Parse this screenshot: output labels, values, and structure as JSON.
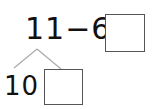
{
  "equation": {
    "expression": "11−6=",
    "answer_box_value": ""
  },
  "decomposition": {
    "part_known": "10",
    "part_unknown_value": ""
  },
  "colors": {
    "text": "#111111",
    "lines": "#aaaaaa",
    "box_border": "#555555"
  }
}
